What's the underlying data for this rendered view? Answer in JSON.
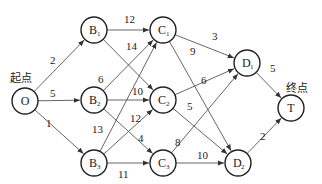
{
  "diagram": {
    "type": "directed-weighted-network",
    "labels": {
      "start": "起点",
      "end": "终点"
    },
    "nodes": [
      {
        "id": "O",
        "main": "O",
        "sub": ""
      },
      {
        "id": "B1",
        "main": "B",
        "sub": "1"
      },
      {
        "id": "B2",
        "main": "B",
        "sub": "2"
      },
      {
        "id": "B3",
        "main": "B",
        "sub": "3"
      },
      {
        "id": "C1",
        "main": "C",
        "sub": "1"
      },
      {
        "id": "C2",
        "main": "C",
        "sub": "2"
      },
      {
        "id": "C3",
        "main": "C",
        "sub": "3"
      },
      {
        "id": "D1",
        "main": "D",
        "sub": "1"
      },
      {
        "id": "D2",
        "main": "D",
        "sub": "2"
      },
      {
        "id": "T",
        "main": "T",
        "sub": ""
      }
    ],
    "edges": [
      {
        "from": "O",
        "to": "B1",
        "weight": "2"
      },
      {
        "from": "O",
        "to": "B2",
        "weight": "5"
      },
      {
        "from": "O",
        "to": "B3",
        "weight": "1"
      },
      {
        "from": "B1",
        "to": "C1",
        "weight": "12"
      },
      {
        "from": "B1",
        "to": "C2",
        "weight": "14"
      },
      {
        "from": "B2",
        "to": "C1",
        "weight": "6"
      },
      {
        "from": "B2",
        "to": "C2",
        "weight": "10"
      },
      {
        "from": "B2",
        "to": "C3",
        "weight": "4"
      },
      {
        "from": "B3",
        "to": "C1",
        "weight": "13"
      },
      {
        "from": "B3",
        "to": "C2",
        "weight": "12"
      },
      {
        "from": "B3",
        "to": "C3",
        "weight": "11"
      },
      {
        "from": "C1",
        "to": "D1",
        "weight": "3"
      },
      {
        "from": "C1",
        "to": "D2",
        "weight": "9"
      },
      {
        "from": "C2",
        "to": "D1",
        "weight": "6"
      },
      {
        "from": "C2",
        "to": "D2",
        "weight": "5"
      },
      {
        "from": "C3",
        "to": "D1",
        "weight": "8"
      },
      {
        "from": "C3",
        "to": "D2",
        "weight": "10"
      },
      {
        "from": "D1",
        "to": "T",
        "weight": "5"
      },
      {
        "from": "D2",
        "to": "T",
        "weight": "2"
      }
    ]
  }
}
